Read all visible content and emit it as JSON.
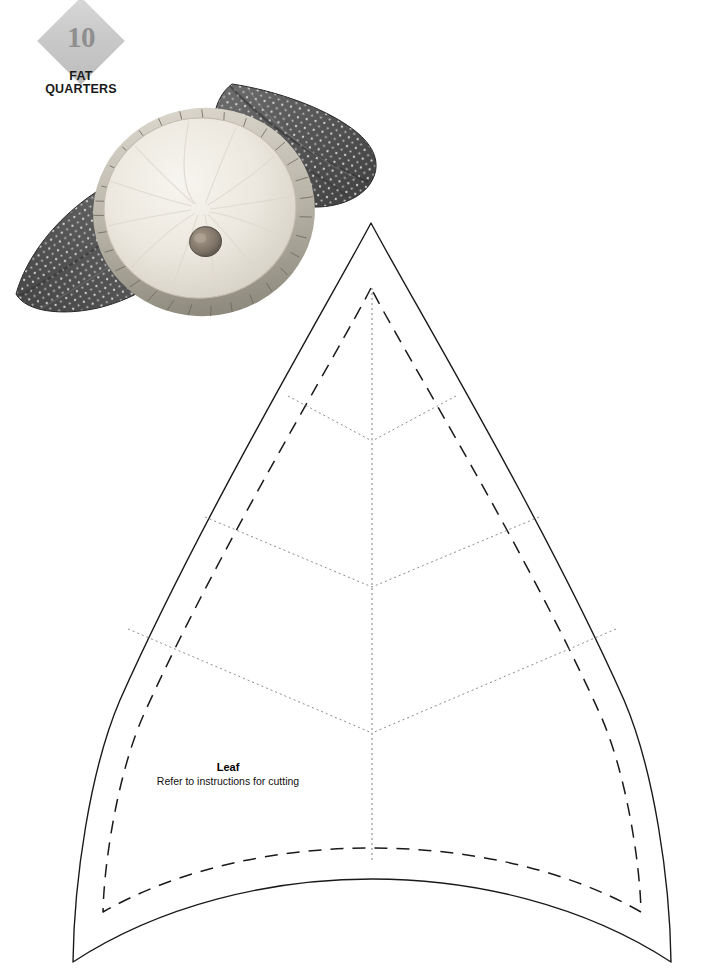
{
  "page": {
    "background_color": "#ffffff",
    "width": 705,
    "height": 980
  },
  "badge": {
    "number": "10",
    "line1": "FAT",
    "line2": "QUARTERS",
    "diamond_color": "#c9c9c9",
    "number_color": "#8f8f8f",
    "text_color": "#1a1a1a"
  },
  "photo": {
    "alt": "Round ruffled pillow resting on polka-dot leaf shaped cushions",
    "pillow_color": "#eeebe3",
    "leaf_fabric_color": "#5a5a5a",
    "button_color": "#8c8176"
  },
  "pattern": {
    "title": "Leaf",
    "subtitle": "Refer to instructions for cutting",
    "cutting_line_color": "#1a1a1a",
    "seam_line_color": "#1a1a1a",
    "vein_line_color": "#8c8c8c",
    "tip_x": 371,
    "tip_y": 223,
    "bottom_left_x": 73,
    "bottom_left_y": 962,
    "bottom_right_x": 671,
    "bottom_right_y": 962,
    "widest_left_x": 56,
    "widest_right_x": 688,
    "widest_y": 792,
    "center_vein_top_y": 288,
    "center_vein_bottom_y": 861,
    "veins": [
      {
        "left_x": 288,
        "left_y": 396,
        "center_y": 441
      },
      {
        "left_x": 205,
        "left_y": 517,
        "center_y": 587
      },
      {
        "left_x": 128,
        "left_y": 629,
        "center_y": 733
      }
    ]
  }
}
